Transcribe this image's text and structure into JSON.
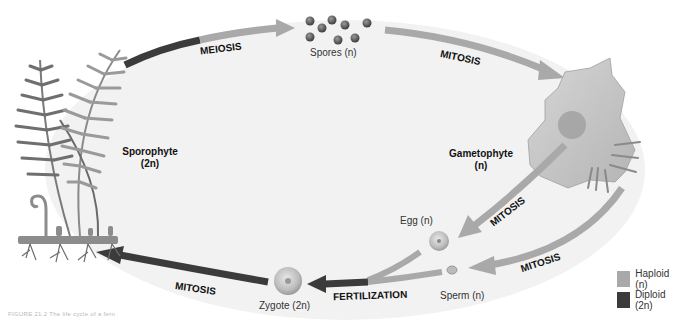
{
  "figure": {
    "caption": "FIGURE 21.2 The life cycle of a fern"
  },
  "stages": {
    "sporophyte": {
      "name": "Sporophyte",
      "ploidy": "(2n)"
    },
    "spores": {
      "label": "Spores (n)"
    },
    "gametophyte": {
      "name": "Gametophyte",
      "ploidy": "(n)"
    },
    "egg": {
      "label": "Egg (n)"
    },
    "sperm": {
      "label": "Sperm (n)"
    },
    "zygote": {
      "label": "Zygote (2n)"
    }
  },
  "processes": {
    "meiosis": "MEIOSIS",
    "mitosis_spores": "MITOSIS",
    "mitosis_egg": "MITOSIS",
    "mitosis_sperm": "MITOSIS",
    "fertilization": "FERTILIZATION",
    "mitosis_zygote": "MITOSIS"
  },
  "legend": {
    "items": [
      {
        "label": "Haploid (n)",
        "color": "#a9a9a9"
      },
      {
        "label": "Diploid (2n)",
        "color": "#3b3b3b"
      }
    ]
  },
  "colors": {
    "haploid": "#a9a9a9",
    "diploid": "#3b3b3b",
    "ellipse_fill": "#f2f2f2"
  }
}
